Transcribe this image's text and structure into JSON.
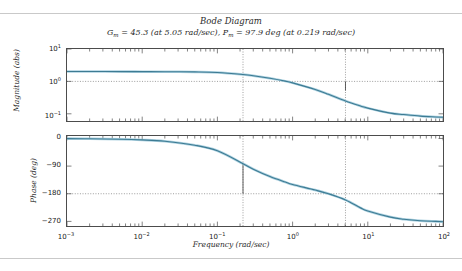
{
  "figure": {
    "title": "Bode Diagram",
    "subtitle_gain_sym": "G",
    "subtitle_gain_sub": "m",
    "subtitle_gain_val": " = 45.3 (at 5.05 rad/sec), ",
    "subtitle_phase_sym": "P",
    "subtitle_phase_sub": "m",
    "subtitle_phase_val": " = 97.9 deg (at 0.219 rad/sec)",
    "subtitle_full": "Gm = 45.3 (at 5.05 rad/sec), Pm = 97.9 deg (at 0.219 rad/sec)"
  },
  "style": {
    "curve_color": "#3d7b93",
    "curve_halo": "#9ec9db",
    "axis_color": "#4c4c4c",
    "grid_dot_color": "#707070",
    "marker_color": "#3a3a3a",
    "rule_color": "#c9c9c9"
  },
  "chart_data": [
    {
      "type": "line",
      "title": "Bode Diagram",
      "subplot": "magnitude",
      "xlabel": "Frequency (rad/sec)",
      "ylabel": "Magnitude (abs)",
      "xscale": "log",
      "yscale": "log",
      "xlim": [
        0.001,
        100
      ],
      "ylim": [
        0.06,
        10
      ],
      "xticks": [
        0.001,
        0.01,
        0.1,
        1,
        10,
        100
      ],
      "xtick_labels": [
        "10-3",
        "10-2",
        "10-1",
        "100",
        "101",
        "102"
      ],
      "yticks": [
        10,
        1,
        0.1
      ],
      "ytick_labels": [
        "101",
        "100",
        "10-1"
      ],
      "grid": false,
      "annotations": [
        {
          "name": "unity-gain-dotted-line",
          "type": "hline",
          "y": 1.0
        },
        {
          "name": "phase-margin-freq-line",
          "type": "vline",
          "x": 0.219
        },
        {
          "name": "gain-margin-freq-line",
          "type": "vline",
          "x": 5.05
        },
        {
          "name": "gain-margin-stem",
          "type": "stem",
          "x": 5.05,
          "y_from": 1.0,
          "y_to": 0.52
        }
      ],
      "x": [
        0.001,
        0.002,
        0.005,
        0.01,
        0.02,
        0.05,
        0.1,
        0.219,
        0.3,
        0.5,
        0.8,
        1.0,
        2.0,
        3.0,
        5.05,
        8.0,
        10.0,
        20.0,
        30.0,
        50.0,
        80.0,
        100.0
      ],
      "y": [
        2.02,
        2.02,
        2.01,
        2.0,
        1.99,
        1.96,
        1.88,
        1.63,
        1.5,
        1.25,
        1.02,
        0.9,
        0.56,
        0.4,
        0.25,
        0.175,
        0.15,
        0.105,
        0.095,
        0.085,
        0.08,
        0.078
      ]
    },
    {
      "type": "line",
      "subplot": "phase",
      "xlabel": "Frequency (rad/sec)",
      "ylabel": "Phase (deg)",
      "xscale": "log",
      "yscale": "linear",
      "xlim": [
        0.001,
        100
      ],
      "ylim": [
        -285,
        8
      ],
      "xticks": [
        0.001,
        0.01,
        0.1,
        1,
        10,
        100
      ],
      "xtick_labels": [
        "10-3",
        "10-2",
        "10-1",
        "100",
        "101",
        "102"
      ],
      "yticks": [
        0,
        -90,
        -180,
        -270
      ],
      "ytick_labels": [
        "0",
        "-90",
        "-180",
        "-270"
      ],
      "grid": false,
      "annotations": [
        {
          "name": "minus180-dotted-line",
          "type": "hline",
          "y": -180
        },
        {
          "name": "phase-margin-freq-line",
          "type": "vline",
          "x": 0.219
        },
        {
          "name": "gain-margin-freq-line",
          "type": "vline",
          "x": 5.05
        },
        {
          "name": "phase-margin-stem",
          "type": "stem",
          "x": 0.219,
          "y_from": -82,
          "y_to": -180
        }
      ],
      "x": [
        0.001,
        0.002,
        0.005,
        0.01,
        0.02,
        0.05,
        0.1,
        0.219,
        0.3,
        0.5,
        0.8,
        1.0,
        2.0,
        3.0,
        5.05,
        8.0,
        10.0,
        20.0,
        30.0,
        50.0,
        80.0,
        100.0
      ],
      "y": [
        -0.5,
        -1.0,
        -2.4,
        -4.8,
        -9.3,
        -22.0,
        -40.0,
        -82.0,
        -100.0,
        -124.0,
        -142.0,
        -150.0,
        -168.0,
        -180.0,
        -200.0,
        -226.0,
        -236.0,
        -256.0,
        -263.0,
        -268.0,
        -270.0,
        -271.0
      ]
    }
  ]
}
